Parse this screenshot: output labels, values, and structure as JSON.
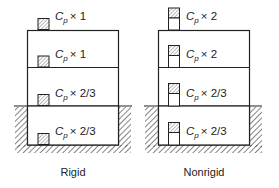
{
  "diagram": {
    "type": "building seismic coefficient comparison",
    "panels": [
      {
        "caption": "Rigid",
        "floors": [
          {
            "level": "roof",
            "label": "C",
            "sub": "p",
            "factor": "× 1",
            "equipment": "rigid"
          },
          {
            "level": "upper",
            "label": "C",
            "sub": "p",
            "factor": "× 1",
            "equipment": "rigid"
          },
          {
            "level": "ground",
            "label": "C",
            "sub": "p",
            "factor": "× 2/3",
            "equipment": "rigid"
          },
          {
            "level": "basement",
            "label": "C",
            "sub": "p",
            "factor": "× 2/3",
            "equipment": "rigid"
          }
        ]
      },
      {
        "caption": "Nonrigid",
        "floors": [
          {
            "level": "roof",
            "label": "C",
            "sub": "p",
            "factor": "× 2",
            "equipment": "nonrigid"
          },
          {
            "level": "upper",
            "label": "C",
            "sub": "p",
            "factor": "× 2",
            "equipment": "nonrigid"
          },
          {
            "level": "ground",
            "label": "C",
            "sub": "p",
            "factor": "× 2/3",
            "equipment": "nonrigid"
          },
          {
            "level": "basement",
            "label": "C",
            "sub": "p",
            "factor": "× 2/3",
            "equipment": "nonrigid"
          }
        ]
      }
    ],
    "colors": {
      "line": "#222222",
      "hatch": "#444444",
      "background": "#ffffff"
    }
  }
}
